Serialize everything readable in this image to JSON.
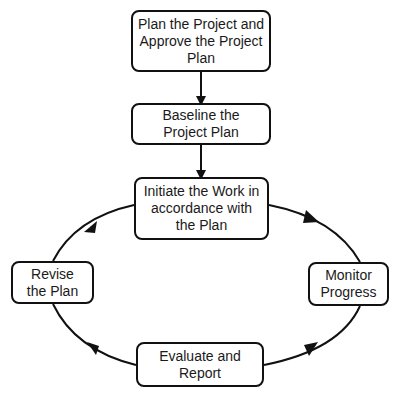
{
  "diagram": {
    "type": "flowchart-cycle",
    "nodes": [
      {
        "id": "plan",
        "label": "Plan the Project and Approve the Project Plan"
      },
      {
        "id": "baseline",
        "label": "Baseline  the Project Plan"
      },
      {
        "id": "initiate",
        "label": "Initiate the Work in accordance with the Plan"
      },
      {
        "id": "monitor",
        "label": "Monitor Progress"
      },
      {
        "id": "evaluate",
        "label": "Evaluate and Report"
      },
      {
        "id": "revise",
        "label": "Revise the Plan"
      }
    ],
    "edges": [
      {
        "from": "plan",
        "to": "baseline"
      },
      {
        "from": "baseline",
        "to": "initiate"
      },
      {
        "from": "initiate",
        "to": "monitor"
      },
      {
        "from": "monitor",
        "to": "evaluate"
      },
      {
        "from": "evaluate",
        "to": "revise"
      },
      {
        "from": "revise",
        "to": "initiate"
      }
    ],
    "colors": {
      "stroke": "#111111",
      "fill": "#ffffff",
      "text": "#1a1a1a"
    }
  }
}
